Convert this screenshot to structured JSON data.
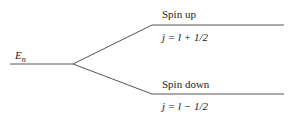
{
  "diagram": {
    "level_label": {
      "symbol": "E",
      "subscript": "n"
    },
    "branches": [
      {
        "name": "Spin up",
        "formula": "j = l + 1/2"
      },
      {
        "name": "Spin down",
        "formula": "j = l − 1/2"
      }
    ],
    "colors": {
      "line": "#555555",
      "text": "#222222"
    }
  }
}
